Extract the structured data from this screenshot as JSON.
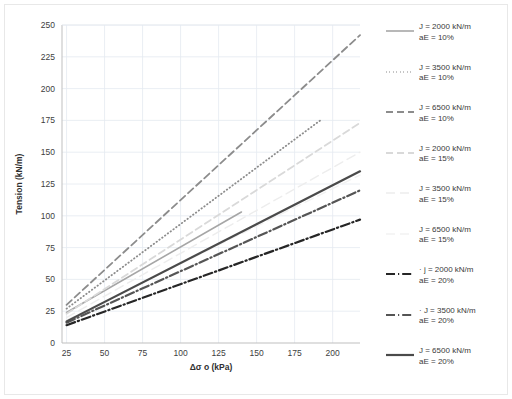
{
  "chart_data": {
    "type": "line",
    "title": "",
    "xlabel": "Δσ o (kPa)",
    "ylabel": "Tension (kN/m)",
    "xlim": [
      22,
      218
    ],
    "ylim": [
      0,
      250
    ],
    "xticks": [
      25,
      50,
      75,
      100,
      125,
      150,
      175,
      200
    ],
    "yticks": [
      0,
      25,
      50,
      75,
      100,
      125,
      150,
      175,
      200,
      225,
      250
    ],
    "grid": true,
    "legend_position": "right",
    "series": [
      {
        "name": "J = 2000 kN/m aE = 10%",
        "label_line1": "J = 2000 kN/m",
        "label_line2": "aE = 10%",
        "style": "solid",
        "color": "#a6a6a6",
        "width": 1.6,
        "x": [
          25,
          140
        ],
        "y": [
          24,
          103
        ]
      },
      {
        "name": "J = 3500 kN/m aE = 10%",
        "label_line1": "J = 3500 kN/m",
        "label_line2": "aE = 10%",
        "style": "dotted",
        "color": "#8c8c8c",
        "width": 1.8,
        "x": [
          25,
          193
        ],
        "y": [
          27,
          176
        ]
      },
      {
        "name": "J = 6500 kN/m aE = 10%",
        "label_line1": "J = 6500 kN/m",
        "label_line2": "aE = 10%",
        "style": "dashed",
        "color": "#8c8c8c",
        "width": 1.8,
        "x": [
          25,
          218
        ],
        "y": [
          30,
          242
        ]
      },
      {
        "name": "J = 2000 kN/m aE = 15%",
        "label_line1": "J = 2000 kN/m",
        "label_line2": "aE = 15%",
        "style": "dashed-light",
        "color": "#d9d9d9",
        "width": 1.8,
        "x": [
          25,
          218
        ],
        "y": [
          23,
          173
        ]
      },
      {
        "name": "J = 3500 kN/m aE = 15%",
        "label_line1": "J = 3500 kN/m",
        "label_line2": "aE = 15%",
        "style": "faint",
        "color": "#ededed",
        "width": 1.4,
        "x": [
          25,
          218
        ],
        "y": [
          20,
          150
        ]
      },
      {
        "name": "J = 6500 kN/m aE = 15%",
        "label_line1": "J = 6500 kN/m",
        "label_line2": "aE = 15%",
        "style": "faint",
        "color": "#f2f2f2",
        "width": 1.4,
        "x": [
          25,
          218
        ],
        "y": [
          18,
          132
        ]
      },
      {
        "name": "J = 2000 kN/m aE = 20%",
        "label_line1": "J = 2000 kN/m",
        "label_line2": "aE = 20%",
        "style": "dashdot-thick",
        "color": "#262626",
        "width": 2.2,
        "x": [
          25,
          218
        ],
        "y": [
          14,
          97
        ]
      },
      {
        "name": "J = 3500 kN/m aE = 20%",
        "label_line1": "J = 3500 kN/m",
        "label_line2": "aE = 20%",
        "style": "dashdot-thick",
        "color": "#555555",
        "width": 2.2,
        "x": [
          25,
          218
        ],
        "y": [
          16,
          120
        ]
      },
      {
        "name": "J = 6500 kN/m aE = 20%",
        "label_line1": "J = 6500 kN/m",
        "label_line2": "aE = 20%",
        "style": "solid-thick",
        "color": "#4a4a4a",
        "width": 2.2,
        "x": [
          25,
          218
        ],
        "y": [
          17,
          135
        ]
      }
    ]
  },
  "legend": {
    "items": [
      {
        "line1": "J = 2000 kN/m",
        "line2": "aE = 10%"
      },
      {
        "line1": "J = 3500 kN/m",
        "line2": "aE = 10%"
      },
      {
        "line1": "J = 6500 kN/m",
        "line2": "aE = 10%"
      },
      {
        "line1": "J = 2000 kN/m",
        "line2": "aE = 15%"
      },
      {
        "line1": "J = 3500 kN/m",
        "line2": "aE = 15%"
      },
      {
        "line1": "J = 6500 kN/m",
        "line2": "aE = 15%"
      },
      {
        "line1": "· j = 2000 kN/m",
        "line2": "aE = 20%"
      },
      {
        "line1": "· J = 3500 kN/m",
        "line2": "aE = 20%"
      },
      {
        "line1": "J = 6500 kN/m",
        "line2": "aE = 20%"
      }
    ]
  },
  "colors": {
    "grid": "#e4eaf0",
    "axis": "#bfbfbf",
    "text": "#404040",
    "background": "#ffffff"
  }
}
